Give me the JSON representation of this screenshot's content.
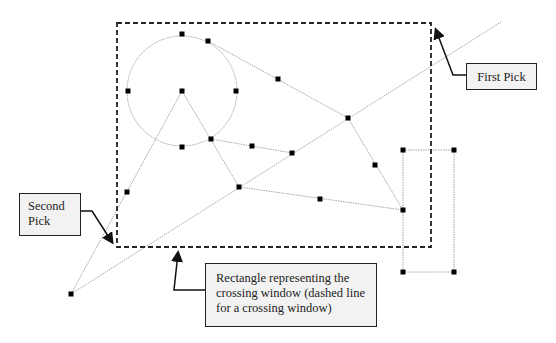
{
  "diagram": {
    "colors": {
      "window_border": "#222222",
      "geometry_line": "#9a9a9a",
      "grip": "#000000",
      "callout_fill": "#f2f2f2",
      "callout_border": "#222222"
    },
    "crossing_window": {
      "x1": 117,
      "y1": 23,
      "x2": 431,
      "y2": 247,
      "style": "dashed"
    },
    "circle": {
      "cx": 182,
      "cy": 91,
      "r": 55,
      "grips": [
        [
          182,
          34
        ],
        [
          128,
          91
        ],
        [
          236,
          91
        ],
        [
          182,
          147
        ],
        [
          182,
          91
        ]
      ]
    },
    "lines": [
      [
        [
          71,
          294
        ],
        [
          501,
          22
        ]
      ],
      [
        [
          71,
          294
        ],
        [
          182,
          91
        ]
      ],
      [
        [
          182,
          91
        ],
        [
          239,
          187
        ]
      ],
      [
        [
          208,
          41
        ],
        [
          348,
          118
        ]
      ],
      [
        [
          211,
          139
        ],
        [
          292,
          153
        ]
      ],
      [
        [
          348,
          118
        ],
        [
          403,
          210
        ]
      ],
      [
        [
          239,
          187
        ],
        [
          403,
          210
        ]
      ]
    ],
    "small_rectangle": {
      "x1": 403,
      "y1": 150,
      "x2": 454,
      "y2": 272
    },
    "grips": [
      [
        208,
        41
      ],
      [
        278,
        79
      ],
      [
        348,
        118
      ],
      [
        211,
        139
      ],
      [
        252,
        146
      ],
      [
        292,
        153
      ],
      [
        375,
        165
      ],
      [
        239,
        187
      ],
      [
        320,
        199
      ],
      [
        403,
        210
      ],
      [
        127,
        192
      ],
      [
        71,
        294
      ],
      [
        403,
        150
      ],
      [
        454,
        150
      ],
      [
        403,
        272
      ],
      [
        454,
        272
      ]
    ]
  },
  "callouts": {
    "first_pick": "First Pick",
    "second_pick": "Second\nPick",
    "rectangle": "Rectangle representing the crossing window (dashed line for a crossing window)"
  }
}
